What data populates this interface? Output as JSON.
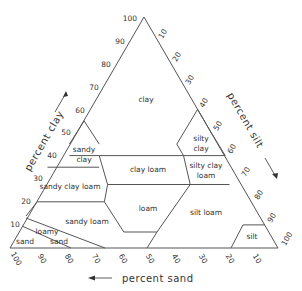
{
  "axes": {
    "clay": {
      "label": "percent clay",
      "ticks": [
        "10",
        "20",
        "30",
        "40",
        "50",
        "60",
        "70",
        "80",
        "90",
        "100"
      ]
    },
    "silt": {
      "label": "percent silt",
      "ticks": [
        "10",
        "20",
        "30",
        "40",
        "50",
        "60",
        "70",
        "80",
        "90",
        "100"
      ]
    },
    "sand": {
      "label": "percent sand",
      "ticks": [
        "100",
        "90",
        "80",
        "70",
        "60",
        "50",
        "40",
        "30",
        "20",
        "10"
      ]
    }
  },
  "classes": [
    {
      "id": "clay",
      "lines": [
        "clay"
      ]
    },
    {
      "id": "sandy-clay",
      "lines": [
        "sandy",
        "clay"
      ]
    },
    {
      "id": "silty-clay",
      "lines": [
        "silty",
        "clay"
      ]
    },
    {
      "id": "clay-loam",
      "lines": [
        "clay loam"
      ]
    },
    {
      "id": "sandy-clay-loam",
      "lines": [
        "sandy clay loam"
      ]
    },
    {
      "id": "silty-clay-loam",
      "lines": [
        "silty clay",
        "loam"
      ]
    },
    {
      "id": "loam",
      "lines": [
        "loam"
      ]
    },
    {
      "id": "sandy-loam",
      "lines": [
        "sandy loam"
      ]
    },
    {
      "id": "silt-loam",
      "lines": [
        "silt loam"
      ]
    },
    {
      "id": "loamy-sand",
      "lines": [
        "loamy",
        "sand"
      ]
    },
    {
      "id": "sand",
      "lines": [
        "sand"
      ]
    },
    {
      "id": "silt",
      "lines": [
        "silt"
      ]
    }
  ]
}
